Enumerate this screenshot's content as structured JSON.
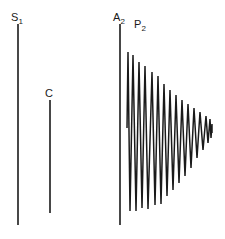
{
  "figure": {
    "type": "phonocardiogram",
    "background_color": "#ffffff",
    "stroke_color": "#1a1a1a",
    "width": 225,
    "height": 239
  },
  "labels": {
    "s1": {
      "base": "S",
      "sub": "1",
      "text": "S1"
    },
    "c": {
      "base": "C",
      "sub": "",
      "text": "C"
    },
    "a2": {
      "base": "A",
      "sub": "2",
      "text": "A2"
    },
    "p2": {
      "base": "P",
      "sub": "2",
      "text": "P2"
    }
  },
  "chart_data": {
    "type": "line",
    "title": "",
    "xlabel": "",
    "ylabel": "",
    "grid": false,
    "legend": "none",
    "xlim": [
      0,
      225
    ],
    "ylim": [
      0,
      239
    ],
    "annotations": [
      {
        "name": "s1",
        "label": "S1",
        "x": 14,
        "y": 17
      },
      {
        "name": "c",
        "label": "C",
        "x": 48,
        "y": 93
      },
      {
        "name": "a2",
        "label": "A2",
        "x": 116,
        "y": 17
      },
      {
        "name": "p2",
        "label": "P2",
        "x": 137,
        "y": 24
      }
    ],
    "series": [
      {
        "name": "s1-spike",
        "kind": "vertical-line",
        "x": 18,
        "y_top": 24,
        "y_bottom": 225,
        "stroke_width": 1.6
      },
      {
        "name": "c-spike",
        "kind": "vertical-line",
        "x": 50,
        "y_top": 100,
        "y_bottom": 213,
        "stroke_width": 1.6
      },
      {
        "name": "a2-spike",
        "kind": "vertical-line",
        "x": 120,
        "y_top": 24,
        "y_bottom": 225,
        "stroke_width": 1.6
      },
      {
        "name": "p2-decaying-oscillation",
        "kind": "polyline",
        "stroke_width": 1.5,
        "baseline_y": 128,
        "x_start": 127,
        "x_end": 212,
        "cycles": 13,
        "points": [
          [
            127,
            128
          ],
          [
            128,
            52
          ],
          [
            130,
            211
          ],
          [
            133,
            55
          ],
          [
            136,
            211
          ],
          [
            139,
            62
          ],
          [
            142,
            208
          ],
          [
            145,
            66
          ],
          [
            148,
            209
          ],
          [
            152,
            72
          ],
          [
            155,
            205
          ],
          [
            158,
            76
          ],
          [
            161,
            204
          ],
          [
            164,
            84
          ],
          [
            167,
            196
          ],
          [
            170,
            90
          ],
          [
            173,
            190
          ],
          [
            176,
            95
          ],
          [
            179,
            183
          ],
          [
            182,
            100
          ],
          [
            185,
            176
          ],
          [
            188,
            104
          ],
          [
            191,
            168
          ],
          [
            194,
            108
          ],
          [
            197,
            158
          ],
          [
            200,
            112
          ],
          [
            203,
            150
          ],
          [
            206,
            116
          ],
          [
            208,
            143
          ],
          [
            210,
            119
          ],
          [
            211,
            138
          ],
          [
            212,
            124
          ],
          [
            212,
            133
          ]
        ]
      }
    ]
  }
}
